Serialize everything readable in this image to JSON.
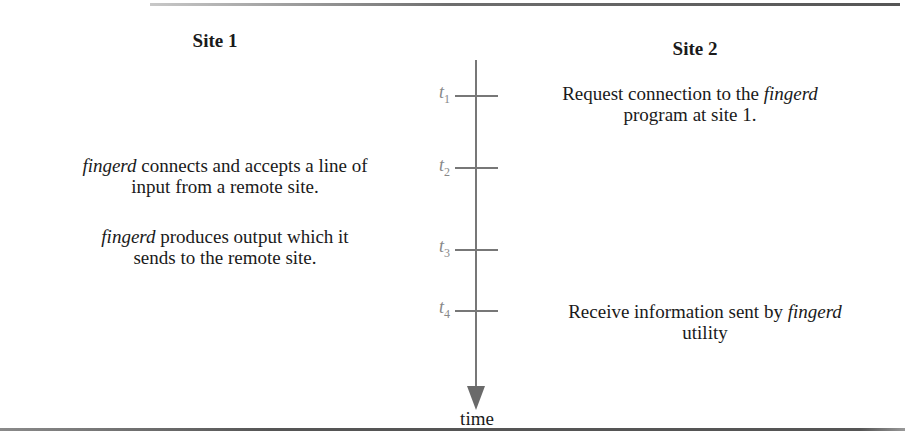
{
  "diagram": {
    "columns": {
      "site1": {
        "heading": "Site 1"
      },
      "site2": {
        "heading": "Site 2"
      }
    },
    "axis": {
      "label": "time",
      "direction": "down",
      "ticks": [
        {
          "var": "t",
          "sub": "1"
        },
        {
          "var": "t",
          "sub": "2"
        },
        {
          "var": "t",
          "sub": "3"
        },
        {
          "var": "t",
          "sub": "4"
        }
      ]
    },
    "events": [
      {
        "time": "t1",
        "site": "Site 2",
        "line1_pre": "Request connection to the ",
        "line1_em": "fingerd",
        "line1_post": "",
        "line2": "program at site 1."
      },
      {
        "time": "t2",
        "site": "Site 1",
        "line1_pre": "",
        "line1_em": "fingerd",
        "line1_post": " connects and accepts a line of",
        "line2": "input from a remote site."
      },
      {
        "time": "t3",
        "site": "Site 1",
        "line1_pre": "",
        "line1_em": "fingerd",
        "line1_post": " produces output which it",
        "line2": "sends to the remote site."
      },
      {
        "time": "t4",
        "site": "Site 2",
        "line1_pre": "Receive information sent by ",
        "line1_em": "fingerd",
        "line1_post": "",
        "line2": "utility"
      }
    ]
  }
}
